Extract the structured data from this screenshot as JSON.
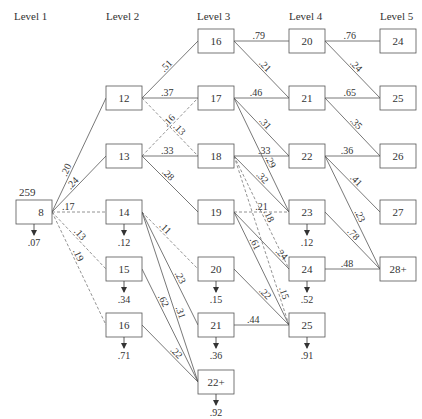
{
  "levels": [
    {
      "label": "Level 1",
      "x": 14,
      "y": 10
    },
    {
      "label": "Level 2",
      "x": 106,
      "y": 10
    },
    {
      "label": "Level 3",
      "x": 197,
      "y": 10
    },
    {
      "label": "Level 4",
      "x": 289,
      "y": 10
    },
    {
      "label": "Level 5",
      "x": 380,
      "y": 10
    }
  ],
  "start_count": "259",
  "nodes": [
    {
      "id": "L1_8",
      "label": "8",
      "x": 16,
      "y": 200,
      "exit": ".07",
      "label_dx": 7
    },
    {
      "id": "L2_12",
      "label": "12",
      "x": 106,
      "y": 86,
      "exit": null
    },
    {
      "id": "L2_13",
      "label": "13",
      "x": 106,
      "y": 144,
      "exit": null
    },
    {
      "id": "L2_14",
      "label": "14",
      "x": 106,
      "y": 200,
      "exit": ".12"
    },
    {
      "id": "L2_15",
      "label": "15",
      "x": 106,
      "y": 257,
      "exit": ".34"
    },
    {
      "id": "L2_16",
      "label": "16",
      "x": 106,
      "y": 313,
      "exit": ".71"
    },
    {
      "id": "L3_16",
      "label": "16",
      "x": 198,
      "y": 29,
      "exit": null
    },
    {
      "id": "L3_17",
      "label": "17",
      "x": 198,
      "y": 86,
      "exit": null
    },
    {
      "id": "L3_18",
      "label": "18",
      "x": 198,
      "y": 144,
      "exit": null
    },
    {
      "id": "L3_19",
      "label": "19",
      "x": 198,
      "y": 200,
      "exit": null
    },
    {
      "id": "L3_20",
      "label": "20",
      "x": 198,
      "y": 257,
      "exit": ".15"
    },
    {
      "id": "L3_21",
      "label": "21",
      "x": 198,
      "y": 313,
      "exit": ".36"
    },
    {
      "id": "L3_22p",
      "label": "22+",
      "x": 198,
      "y": 370,
      "exit": ".92"
    },
    {
      "id": "L4_20",
      "label": "20",
      "x": 289,
      "y": 29,
      "exit": null
    },
    {
      "id": "L4_21",
      "label": "21",
      "x": 289,
      "y": 86,
      "exit": null
    },
    {
      "id": "L4_22",
      "label": "22",
      "x": 289,
      "y": 144,
      "exit": null
    },
    {
      "id": "L4_23",
      "label": "23",
      "x": 289,
      "y": 200,
      "exit": ".12"
    },
    {
      "id": "L4_24",
      "label": "24",
      "x": 289,
      "y": 257,
      "exit": ".52"
    },
    {
      "id": "L4_25",
      "label": "25",
      "x": 289,
      "y": 313,
      "exit": ".91"
    },
    {
      "id": "L5_24",
      "label": "24",
      "x": 380,
      "y": 29,
      "exit": null
    },
    {
      "id": "L5_25",
      "label": "25",
      "x": 380,
      "y": 86,
      "exit": null
    },
    {
      "id": "L5_26",
      "label": "26",
      "x": 380,
      "y": 144,
      "exit": null
    },
    {
      "id": "L5_27",
      "label": "27",
      "x": 380,
      "y": 200,
      "exit": null
    },
    {
      "id": "L5_28p",
      "label": "28+",
      "x": 380,
      "y": 257,
      "exit": null
    }
  ],
  "edges": [
    {
      "from": "L1_8",
      "to": "L2_12",
      "p": ".20",
      "dashed": false,
      "t": 0.35
    },
    {
      "from": "L1_8",
      "to": "L2_13",
      "p": ".24",
      "dashed": false,
      "t": 0.45
    },
    {
      "from": "L1_8",
      "to": "L2_14",
      "p": ".17",
      "dashed": true,
      "t": 0.3
    },
    {
      "from": "L1_8",
      "to": "L2_15",
      "p": ".13",
      "dashed": true,
      "t": 0.45
    },
    {
      "from": "L1_8",
      "to": "L2_16",
      "p": ".19",
      "dashed": true,
      "t": 0.4
    },
    {
      "from": "L2_12",
      "to": "L3_16",
      "p": ".51",
      "dashed": false,
      "t": 0.5
    },
    {
      "from": "L2_12",
      "to": "L3_17",
      "p": ".37",
      "dashed": false,
      "t": 0.45
    },
    {
      "from": "L2_12",
      "to": "L3_18",
      "p": ".13",
      "dashed": true,
      "t": 0.6
    },
    {
      "from": "L2_13",
      "to": "L3_17",
      "p": ".16",
      "dashed": true,
      "t": 0.55
    },
    {
      "from": "L2_13",
      "to": "L3_18",
      "p": ".33",
      "dashed": false,
      "t": 0.45
    },
    {
      "from": "L2_13",
      "to": "L3_19",
      "p": ".28",
      "dashed": false,
      "t": 0.4
    },
    {
      "from": "L2_14",
      "to": "L3_20",
      "p": ".11",
      "dashed": true,
      "t": 0.35
    },
    {
      "from": "L2_14",
      "to": "L3_21",
      "p": ".23",
      "dashed": false,
      "t": 0.6
    },
    {
      "from": "L2_14",
      "to": "L3_22p",
      "p": ".31",
      "dashed": false,
      "t": 0.6
    },
    {
      "from": "L2_15",
      "to": "L3_22p",
      "p": ".62",
      "dashed": false,
      "t": 0.3
    },
    {
      "from": "L2_16",
      "to": "L3_22p",
      "p": ".22",
      "dashed": false,
      "t": 0.55
    },
    {
      "from": "L3_16",
      "to": "L4_20",
      "p": ".79",
      "dashed": false,
      "t": 0.45
    },
    {
      "from": "L3_16",
      "to": "L4_21",
      "p": ".21",
      "dashed": false,
      "t": 0.5
    },
    {
      "from": "L3_17",
      "to": "L4_21",
      "p": ".46",
      "dashed": false,
      "t": 0.4
    },
    {
      "from": "L3_17",
      "to": "L4_22",
      "p": ".31",
      "dashed": false,
      "t": 0.5
    },
    {
      "from": "L3_17",
      "to": "L4_23",
      "p": ".29",
      "dashed": false,
      "t": 0.58
    },
    {
      "from": "L3_18",
      "to": "L4_22",
      "p": ".33",
      "dashed": false,
      "t": 0.55
    },
    {
      "from": "L3_18",
      "to": "L4_23",
      "p": ".32",
      "dashed": false,
      "t": 0.45
    },
    {
      "from": "L3_18",
      "to": "L4_24",
      "p": ".18",
      "dashed": true,
      "t": 0.55
    },
    {
      "from": "L3_18",
      "to": "L4_25",
      "p": ".15",
      "dashed": true,
      "t": 0.82
    },
    {
      "from": "L3_19",
      "to": "L4_23",
      "p": ".21",
      "dashed": true,
      "t": 0.5
    },
    {
      "from": "L3_19",
      "to": "L4_24",
      "p": ".24",
      "dashed": false,
      "t": 0.8
    },
    {
      "from": "L3_19",
      "to": "L4_25",
      "p": ".61",
      "dashed": false,
      "t": 0.3
    },
    {
      "from": "L3_20",
      "to": "L4_25",
      "p": ".22",
      "dashed": false,
      "t": 0.5
    },
    {
      "from": "L3_21",
      "to": "L4_25",
      "p": ".44",
      "dashed": false,
      "t": 0.35
    },
    {
      "from": "L4_20",
      "to": "L5_24",
      "p": ".76",
      "dashed": false,
      "t": 0.45
    },
    {
      "from": "L4_20",
      "to": "L5_25",
      "p": ".24",
      "dashed": false,
      "t": 0.5
    },
    {
      "from": "L4_21",
      "to": "L5_25",
      "p": ".65",
      "dashed": false,
      "t": 0.45
    },
    {
      "from": "L4_21",
      "to": "L5_26",
      "p": ".35",
      "dashed": false,
      "t": 0.5
    },
    {
      "from": "L4_22",
      "to": "L5_26",
      "p": ".36",
      "dashed": false,
      "t": 0.4
    },
    {
      "from": "L4_22",
      "to": "L5_27",
      "p": ".41",
      "dashed": false,
      "t": 0.5
    },
    {
      "from": "L4_22",
      "to": "L5_28p",
      "p": ".23",
      "dashed": false,
      "t": 0.55
    },
    {
      "from": "L4_23",
      "to": "L5_28p",
      "p": ".78",
      "dashed": false,
      "t": 0.45
    },
    {
      "from": "L4_24",
      "to": "L5_28p",
      "p": ".48",
      "dashed": false,
      "t": 0.4
    }
  ],
  "style": {
    "line_color": "#555555",
    "dash_color": "#777777",
    "box_stroke": "#555555",
    "text_color": "#333333"
  }
}
